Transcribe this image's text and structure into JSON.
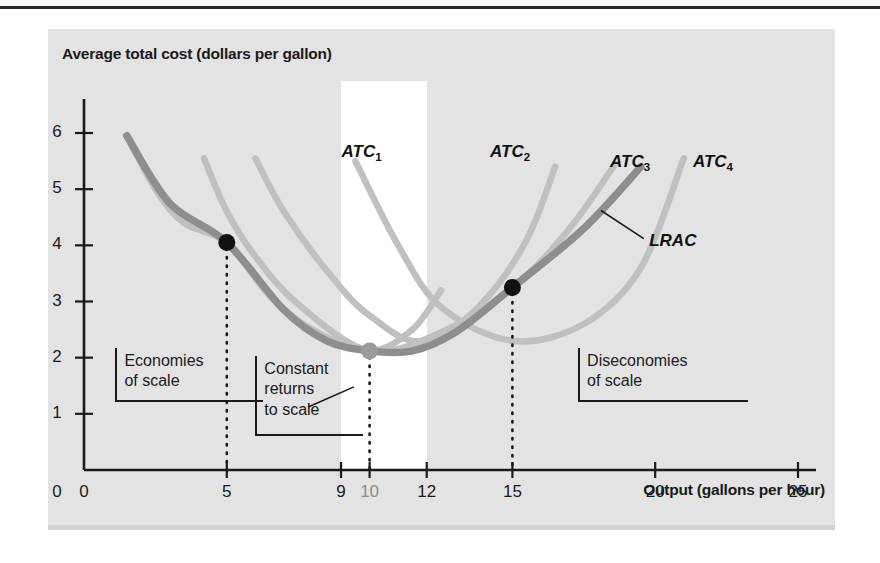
{
  "figure": {
    "y_axis_title": "Average total cost (dollars per gallon)",
    "x_axis_title": "Output (gallons per hour)"
  },
  "ticks": {
    "y": [
      "0",
      "1",
      "2",
      "3",
      "4",
      "5",
      "6"
    ],
    "x": [
      "0",
      "5",
      "9",
      "10",
      "12",
      "15",
      "20",
      "25"
    ]
  },
  "curve_labels": {
    "atc1_base": "ATC",
    "atc1_sub": "1",
    "atc2_base": "ATC",
    "atc2_sub": "2",
    "atc3_base": "ATC",
    "atc3_sub": "3",
    "atc4_base": "ATC",
    "atc4_sub": "4",
    "lrac": "LRAC"
  },
  "annotations": {
    "economies": "Economies\nof scale",
    "economies_line1": "Economies",
    "economies_line2": "of scale",
    "constant_line1": "Constant",
    "constant_line2": "returns",
    "constant_line3": "to scale",
    "diseconomies_line1": "Diseconomies",
    "diseconomies_line2": "of scale"
  },
  "colors": {
    "figure_background": "#e3e3e3",
    "highlight_band": "#ffffff",
    "lrac_curve": "#8e8e8e",
    "atc_curve": "#c0c0c0",
    "axis": "#1a1a1a",
    "marker_dark": "#111111",
    "marker_light": "#9a9a9a",
    "text": "#1a1a1a"
  },
  "chart_data": {
    "type": "line",
    "title": "",
    "xlabel": "Output (gallons per hour)",
    "ylabel": "Average total cost (dollars per gallon)",
    "xlim": [
      0,
      25
    ],
    "ylim": [
      0,
      6.6
    ],
    "grid": false,
    "legend": "inline-curve-labels",
    "highlight_band": {
      "label": "Constant returns to scale",
      "x_start": 9,
      "x_end": 12
    },
    "series": [
      {
        "name": "ATC1",
        "style": "short-run average total cost",
        "color": "#c0c0c0",
        "points": [
          {
            "x": 1.5,
            "y": 5.95
          },
          {
            "x": 2.5,
            "y": 5.0
          },
          {
            "x": 3.5,
            "y": 4.4
          },
          {
            "x": 5.0,
            "y": 4.05
          },
          {
            "x": 6.5,
            "y": 3.1
          },
          {
            "x": 8.0,
            "y": 2.5
          },
          {
            "x": 10.0,
            "y": 2.12
          },
          {
            "x": 11.5,
            "y": 2.5
          },
          {
            "x": 12.5,
            "y": 3.2
          }
        ]
      },
      {
        "name": "ATC2",
        "style": "short-run average total cost",
        "color": "#c0c0c0",
        "points": [
          {
            "x": 4.2,
            "y": 5.55
          },
          {
            "x": 5.0,
            "y": 4.6
          },
          {
            "x": 6.0,
            "y": 3.8
          },
          {
            "x": 7.5,
            "y": 2.95
          },
          {
            "x": 10.0,
            "y": 2.12
          },
          {
            "x": 12.5,
            "y": 2.45
          },
          {
            "x": 14.0,
            "y": 3.0
          },
          {
            "x": 15.5,
            "y": 4.1
          },
          {
            "x": 16.5,
            "y": 5.4
          }
        ]
      },
      {
        "name": "ATC3",
        "style": "short-run average total cost",
        "color": "#c0c0c0",
        "points": [
          {
            "x": 6.0,
            "y": 5.55
          },
          {
            "x": 7.0,
            "y": 4.6
          },
          {
            "x": 8.5,
            "y": 3.55
          },
          {
            "x": 10.0,
            "y": 2.75
          },
          {
            "x": 12.0,
            "y": 2.3
          },
          {
            "x": 15.0,
            "y": 3.25
          },
          {
            "x": 17.0,
            "y": 4.3
          },
          {
            "x": 18.6,
            "y": 5.45
          }
        ]
      },
      {
        "name": "ATC4",
        "style": "short-run average total cost",
        "color": "#c0c0c0",
        "points": [
          {
            "x": 9.5,
            "y": 5.5
          },
          {
            "x": 11.0,
            "y": 4.0
          },
          {
            "x": 12.5,
            "y": 2.9
          },
          {
            "x": 15.0,
            "y": 2.3
          },
          {
            "x": 17.5,
            "y": 2.6
          },
          {
            "x": 19.5,
            "y": 3.6
          },
          {
            "x": 21.0,
            "y": 5.55
          }
        ]
      },
      {
        "name": "LRAC",
        "style": "long-run average cost envelope",
        "color": "#8e8e8e",
        "points": [
          {
            "x": 1.5,
            "y": 5.95
          },
          {
            "x": 3.0,
            "y": 4.75
          },
          {
            "x": 5.0,
            "y": 4.05
          },
          {
            "x": 7.0,
            "y": 2.85
          },
          {
            "x": 8.5,
            "y": 2.3
          },
          {
            "x": 10.0,
            "y": 2.12
          },
          {
            "x": 11.5,
            "y": 2.12
          },
          {
            "x": 13.0,
            "y": 2.45
          },
          {
            "x": 15.0,
            "y": 3.25
          },
          {
            "x": 17.5,
            "y": 4.3
          },
          {
            "x": 19.5,
            "y": 5.4
          }
        ]
      }
    ],
    "markers": [
      {
        "x": 5,
        "y": 4.05,
        "color": "#111111",
        "dropline": true
      },
      {
        "x": 10,
        "y": 2.12,
        "color": "#9a9a9a",
        "dropline": true
      },
      {
        "x": 15,
        "y": 3.25,
        "color": "#111111",
        "dropline": true
      }
    ],
    "annotations": [
      {
        "text": "Economies of scale",
        "region": "x < 9"
      },
      {
        "text": "Constant returns to scale",
        "region": "9 <= x <= 12"
      },
      {
        "text": "Diseconomies of scale",
        "region": "x > 12"
      }
    ]
  }
}
